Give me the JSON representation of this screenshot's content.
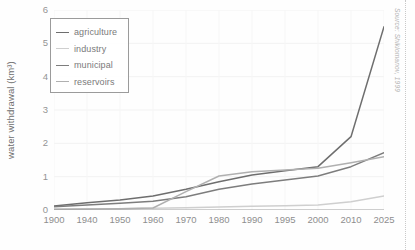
{
  "chart_data": {
    "type": "line",
    "title": "",
    "xlabel": "",
    "ylabel": "water withdrawal (km³)",
    "x": [
      "1900",
      "1940",
      "1950",
      "1960",
      "1970",
      "1980",
      "1990",
      "1995",
      "2000",
      "2010",
      "2025"
    ],
    "xtick_labels": [
      "1900",
      "1940",
      "1950",
      "1960",
      "1970",
      "1980",
      "1990",
      "1995",
      "2000",
      "2010",
      "2025"
    ],
    "ytick_labels": [
      "0",
      "1",
      "2",
      "3",
      "4",
      "5",
      "6"
    ],
    "ylim": [
      0,
      6
    ],
    "grid": true,
    "legend_position": "upper-left",
    "series": [
      {
        "name": "agriculture",
        "color": "#6e6e6e",
        "values": [
          0.12,
          0.22,
          0.3,
          0.42,
          0.62,
          0.85,
          1.05,
          1.18,
          1.3,
          2.2,
          5.5
        ]
      },
      {
        "name": "industry",
        "color": "#cfcfcf",
        "values": [
          0.02,
          0.03,
          0.04,
          0.05,
          0.07,
          0.09,
          0.11,
          0.13,
          0.15,
          0.25,
          0.42
        ]
      },
      {
        "name": "municipal",
        "color": "#7d7d7d",
        "values": [
          0.1,
          0.15,
          0.2,
          0.26,
          0.4,
          0.62,
          0.78,
          0.9,
          1.02,
          1.3,
          1.72
        ]
      },
      {
        "name": "reservoirs",
        "color": "#b0b0b0",
        "values": [
          0.02,
          0.03,
          0.04,
          0.06,
          0.55,
          1.02,
          1.15,
          1.2,
          1.25,
          1.42,
          1.6
        ]
      }
    ],
    "source_note": "Source: Shiklomanov, 1999"
  },
  "legend": {
    "items": [
      {
        "label": "agriculture"
      },
      {
        "label": "industry"
      },
      {
        "label": "municipal"
      },
      {
        "label": "reservoirs"
      }
    ]
  }
}
